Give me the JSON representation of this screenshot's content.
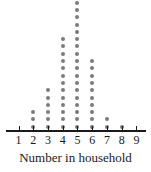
{
  "chart_data": {
    "type": "dotplot",
    "title": "",
    "xlabel": "Number in household",
    "ylabel": "",
    "categories": [
      1,
      2,
      3,
      4,
      5,
      6,
      7,
      8,
      9
    ],
    "values": [
      0,
      3,
      6,
      13,
      18,
      10,
      2,
      1,
      0
    ],
    "tick_labels": [
      "1",
      "2",
      "3",
      "4",
      "5",
      "6",
      "7",
      "8",
      "9"
    ],
    "xlim": [
      1,
      9
    ],
    "grid": false,
    "legend": "none",
    "dot_color": "#7b7b7b",
    "axis_color": "#1a1a1a",
    "background_color": "#ffffff"
  }
}
